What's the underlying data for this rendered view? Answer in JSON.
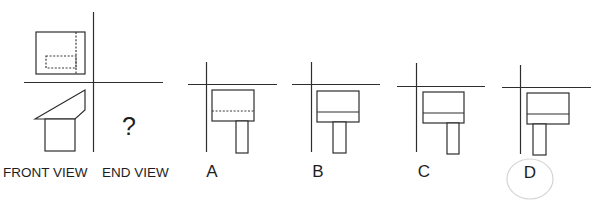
{
  "question": {
    "front_view_label": "FRONT VIEW",
    "end_view_label": "END VIEW",
    "unknown_mark": "?",
    "top_view_hidden_lines": "dashed",
    "front_view_shape": "sloped trapezoid top with rectangular base"
  },
  "options": [
    {
      "letter": "A",
      "middle_line_style": "dashed"
    },
    {
      "letter": "B",
      "middle_line_style": "solid"
    },
    {
      "letter": "C",
      "middle_line_style": "solid"
    },
    {
      "letter": "D",
      "middle_line_style": "solid"
    }
  ],
  "selected_answer": "D",
  "colors": {
    "line": "#2e2e2e",
    "answer_circle": "#d4d4d4",
    "background": "#ffffff"
  }
}
